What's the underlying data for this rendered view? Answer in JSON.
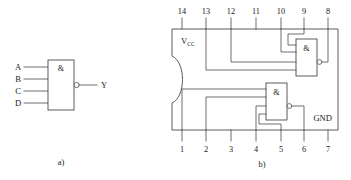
{
  "figure": {
    "panels": [
      {
        "id": "a",
        "caption": "a)",
        "description": "Four-input NAND logic symbol"
      },
      {
        "id": "b",
        "caption": "b)",
        "description": "14-pin DIP package with two NAND gates wired"
      }
    ]
  },
  "symbol": {
    "gate_marker": "&",
    "inputs": [
      {
        "label": "A"
      },
      {
        "label": "B"
      },
      {
        "label": "C"
      },
      {
        "label": "D"
      }
    ],
    "output": {
      "label": "Y",
      "inverted": true
    }
  },
  "package": {
    "supply_label": "V",
    "supply_subscript": "CC",
    "ground_label": "GND",
    "notch_side": "left",
    "pin_count": 14,
    "top_pins": [
      {
        "number": "14"
      },
      {
        "number": "13"
      },
      {
        "number": "12"
      },
      {
        "number": "11"
      },
      {
        "number": "10"
      },
      {
        "number": "9"
      },
      {
        "number": "8"
      }
    ],
    "bottom_pins": [
      {
        "number": "1"
      },
      {
        "number": "2"
      },
      {
        "number": "3"
      },
      {
        "number": "4"
      },
      {
        "number": "5"
      },
      {
        "number": "6"
      },
      {
        "number": "7"
      }
    ],
    "gates": [
      {
        "id": "upper-gate",
        "marker": "&",
        "inverted_output": true,
        "input_pins": [
          "9",
          "10",
          "12",
          "13"
        ],
        "output_pin": "8"
      },
      {
        "id": "lower-gate",
        "marker": "&",
        "inverted_output": true,
        "input_pins": [
          "1",
          "2",
          "4",
          "5"
        ],
        "output_pin": "6"
      }
    ]
  },
  "colors": {
    "line": "#4a4a4a",
    "text": "#1a1a1a",
    "background": "#ffffff"
  }
}
